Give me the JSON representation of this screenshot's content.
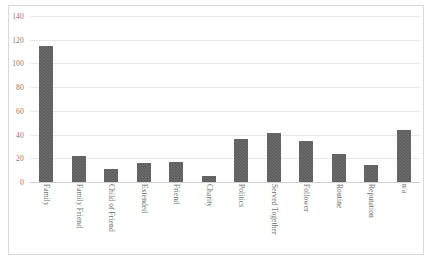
{
  "chart_data": {
    "type": "bar",
    "title": "",
    "subtitle": "",
    "xlabel": "",
    "ylabel": "",
    "ylim": [
      0,
      140
    ],
    "ytick_step": 20,
    "yticks": [
      "140",
      "120",
      "100",
      "80",
      "60",
      "40",
      "20",
      "0"
    ],
    "grid": true,
    "legend": false,
    "legend_position": "none",
    "bar_color": "#595959",
    "gridline_color": "#e8e8e8",
    "frame_color": "#d9d9d9",
    "categories": [
      "Family",
      "Family Friend",
      "Child of Friend",
      "Extended",
      "Friend",
      "Charity",
      "Politics",
      "Served Together",
      "Follower",
      "Routine",
      "Reputation",
      "n/a"
    ],
    "values": [
      115,
      22,
      11,
      16,
      17,
      5,
      36,
      41,
      35,
      24,
      14,
      44
    ],
    "series": [
      {
        "name": "Count",
        "values": [
          115,
          22,
          11,
          16,
          17,
          5,
          36,
          41,
          35,
          24,
          14,
          44
        ]
      }
    ]
  }
}
